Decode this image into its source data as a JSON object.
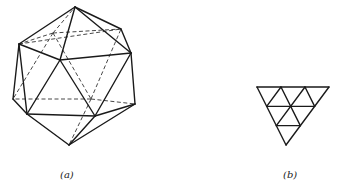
{
  "figure": {
    "panels": [
      {
        "id": "a",
        "label": "(a)",
        "description": "icosahedron wireframe with hidden edges dashed",
        "vertices": {
          "T": [
            75,
            7
          ],
          "UL": [
            19,
            44
          ],
          "UR": [
            121,
            29
          ],
          "C": [
            60,
            60
          ],
          "R": [
            131,
            53
          ],
          "L": [
            13,
            99
          ],
          "LL": [
            27,
            114
          ],
          "LC": [
            95,
            116
          ],
          "RL": [
            135,
            104
          ],
          "B": [
            69,
            145
          ],
          "H1": [
            53,
            33
          ],
          "H2": [
            91,
            99
          ]
        },
        "solid_edges": [
          [
            "T",
            "UL"
          ],
          [
            "T",
            "UR"
          ],
          [
            "T",
            "C"
          ],
          [
            "T",
            "R"
          ],
          [
            "UL",
            "C"
          ],
          [
            "UL",
            "L"
          ],
          [
            "UL",
            "LL"
          ],
          [
            "C",
            "R"
          ],
          [
            "C",
            "LL"
          ],
          [
            "C",
            "LC"
          ],
          [
            "UR",
            "R"
          ],
          [
            "R",
            "RL"
          ],
          [
            "R",
            "LC"
          ],
          [
            "L",
            "LL"
          ],
          [
            "LL",
            "LC"
          ],
          [
            "LL",
            "B"
          ],
          [
            "LC",
            "B"
          ],
          [
            "LC",
            "RL"
          ],
          [
            "RL",
            "B"
          ]
        ],
        "dashed_edges": [
          [
            "H1",
            "UL"
          ],
          [
            "H1",
            "UR"
          ],
          [
            "H1",
            "T"
          ],
          [
            "H1",
            "L"
          ],
          [
            "H1",
            "H2"
          ],
          [
            "H2",
            "L"
          ],
          [
            "H2",
            "RL"
          ],
          [
            "H2",
            "B"
          ],
          [
            "H2",
            "UR"
          ],
          [
            "UL",
            "UR"
          ]
        ]
      },
      {
        "id": "b",
        "label": "(b)",
        "description": "equilateral triangle subdivided into 9 smaller triangles",
        "triangle": {
          "top_left": [
            257,
            87
          ],
          "top_right": [
            329,
            87
          ],
          "bottom": [
            286,
            145
          ]
        },
        "subdivisions": 3
      }
    ]
  }
}
